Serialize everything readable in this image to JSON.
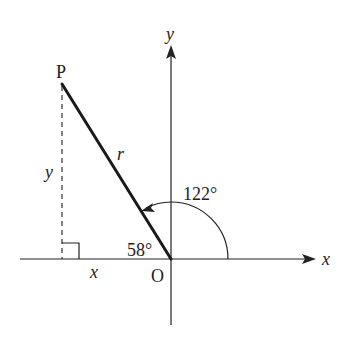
{
  "diagram": {
    "labels": {
      "y_axis": "y",
      "x_axis": "x",
      "origin": "O",
      "point": "P",
      "radius": "r",
      "vertical_side": "y",
      "horizontal_side": "x",
      "angle_main": "122°",
      "angle_reference": "58°"
    },
    "values": {
      "angle_from_positive_x_deg": 122,
      "reference_angle_deg": 58
    },
    "colors": {
      "line": "#222222",
      "background": "#ffffff"
    }
  }
}
